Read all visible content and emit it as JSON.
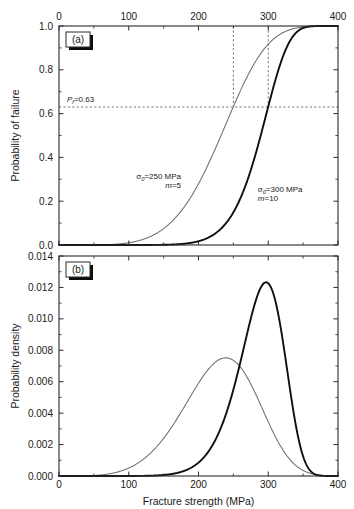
{
  "figure": {
    "width": 354,
    "height": 509,
    "background": "#ffffff"
  },
  "panels": {
    "a": {
      "letter": "(a)",
      "ylabel": "Probability of failure",
      "y_ticks": [
        "0.0",
        "0.2",
        "0.4",
        "0.6",
        "0.8",
        "1.0"
      ],
      "x_ticks": [
        "0",
        "100",
        "200",
        "300",
        "400"
      ],
      "x_axis_position": "top",
      "annotations": {
        "pf_label_main": "P",
        "pf_label_sub": "f",
        "pf_label_value": "=0.63",
        "curve1_sigma_main": "σ",
        "curve1_sigma_sub": "0",
        "curve1_sigma_value": "=250 MPa",
        "curve1_m_italic": "m",
        "curve1_m_value": "=5",
        "curve2_sigma_main": "σ",
        "curve2_sigma_sub": "0",
        "curve2_sigma_value": "=300 MPa",
        "curve2_m_italic": "m",
        "curve2_m_value": "=10"
      }
    },
    "b": {
      "letter": "(b)",
      "ylabel": "Probability density",
      "y_ticks": [
        "0.000",
        "0.002",
        "0.004",
        "0.006",
        "0.008",
        "0.010",
        "0.012",
        "0.014"
      ],
      "x_ticks": [
        "0",
        "100",
        "200",
        "300",
        "400"
      ],
      "x_axis_position": "bottom"
    }
  },
  "xlabel": "Fracture strength (MPa)",
  "colors": {
    "curve_m5": "#6e6e6e",
    "curve_m10": "#101010",
    "axis": "#2b2b2b",
    "guide": "#555555",
    "text": "#1a1a1a",
    "background": "#ffffff"
  },
  "chart_data": [
    {
      "type": "line",
      "panel": "(a)",
      "title": "",
      "xlabel": "Fracture strength (MPa)",
      "ylabel": "Probability of failure",
      "xlim": [
        0,
        400
      ],
      "ylim": [
        0.0,
        1.0
      ],
      "xticks": [
        0,
        100,
        200,
        300,
        400
      ],
      "yticks": [
        0.0,
        0.2,
        0.4,
        0.6,
        0.8,
        1.0
      ],
      "x_axis_position": "top",
      "grid": false,
      "legend": "none",
      "function": "Weibull CDF: P = 1 - exp(-(x/sigma0)^m)",
      "series": [
        {
          "name": "sigma0=250 MPa, m=5",
          "color": "#6e6e6e",
          "linewidth": "thin",
          "sigma0": 250,
          "m": 5,
          "x": [
            0,
            20,
            40,
            60,
            80,
            100,
            120,
            140,
            160,
            180,
            200,
            220,
            240,
            250,
            260,
            280,
            300,
            320,
            340,
            360,
            380,
            400
          ],
          "y": [
            0.0,
            0.0,
            0.0,
            0.001,
            0.001,
            0.01,
            0.022,
            0.058,
            0.114,
            0.201,
            0.306,
            0.441,
            0.585,
            0.632,
            0.704,
            0.788,
            0.885,
            0.942,
            0.975,
            0.99,
            0.996,
            0.999
          ]
        },
        {
          "name": "sigma0=300 MPa, m=10",
          "color": "#101010",
          "linewidth": "thick",
          "sigma0": 300,
          "m": 10,
          "x": [
            0,
            50,
            100,
            120,
            140,
            160,
            180,
            200,
            220,
            240,
            260,
            280,
            300,
            310,
            320,
            340,
            360,
            380,
            400
          ],
          "y": [
            0.0,
            0.0,
            0.0,
            0.0,
            0.001,
            0.003,
            0.008,
            0.017,
            0.042,
            0.095,
            0.192,
            0.349,
            0.632,
            0.712,
            0.8,
            0.93,
            0.983,
            0.997,
            1.0
          ]
        }
      ],
      "annotations": [
        {
          "text": "Pf=0.63",
          "x": 62,
          "y": 0.63,
          "type": "horizontal-guide-label"
        },
        {
          "text": "sigma0=250 MPa / m=5",
          "x": 175,
          "y": 0.3,
          "type": "curve-label"
        },
        {
          "text": "sigma0=300 MPa / m=10",
          "x": 285,
          "y": 0.24,
          "type": "curve-label"
        }
      ],
      "guides": [
        {
          "type": "horizontal",
          "value": 0.63,
          "style": "dashed"
        },
        {
          "type": "vertical",
          "value": 250,
          "style": "dashed"
        },
        {
          "type": "vertical",
          "value": 300,
          "style": "dashed"
        }
      ]
    },
    {
      "type": "line",
      "panel": "(b)",
      "title": "",
      "xlabel": "Fracture strength (MPa)",
      "ylabel": "Probability density",
      "xlim": [
        0,
        400
      ],
      "ylim": [
        0.0,
        0.014
      ],
      "xticks": [
        0,
        100,
        200,
        300,
        400
      ],
      "yticks": [
        0.0,
        0.002,
        0.004,
        0.006,
        0.008,
        0.01,
        0.012,
        0.014
      ],
      "x_axis_position": "bottom",
      "grid": false,
      "legend": "none",
      "function": "Weibull PDF: p = (m/sigma0)(x/sigma0)^(m-1) exp(-(x/sigma0)^m)",
      "series": [
        {
          "name": "sigma0=250 MPa, m=5",
          "color": "#6e6e6e",
          "linewidth": "thin",
          "sigma0": 250,
          "m": 5,
          "peak_x": 235,
          "peak_y": 0.0076,
          "x": [
            0,
            40,
            60,
            80,
            100,
            120,
            140,
            160,
            180,
            200,
            220,
            235,
            250,
            270,
            290,
            310,
            330,
            350,
            370,
            390,
            400
          ],
          "y": [
            0.0,
            0.0001,
            0.0003,
            0.0007,
            0.0013,
            0.0022,
            0.0033,
            0.0046,
            0.0059,
            0.0069,
            0.0075,
            0.0076,
            0.0074,
            0.0065,
            0.005,
            0.0034,
            0.0019,
            0.0009,
            0.0003,
            0.0001,
            0.0
          ]
        },
        {
          "name": "sigma0=300 MPa, m=10",
          "color": "#101010",
          "linewidth": "thick",
          "sigma0": 300,
          "m": 10,
          "peak_x": 300,
          "peak_y": 0.0123,
          "x": [
            0,
            80,
            120,
            150,
            170,
            190,
            210,
            230,
            250,
            265,
            280,
            290,
            300,
            310,
            320,
            330,
            345,
            360,
            375,
            390,
            400
          ],
          "y": [
            0.0,
            0.0,
            0.0001,
            0.0002,
            0.0005,
            0.001,
            0.0019,
            0.0035,
            0.006,
            0.008,
            0.0102,
            0.0114,
            0.0123,
            0.0122,
            0.0112,
            0.0093,
            0.0057,
            0.0026,
            0.0008,
            0.0001,
            0.0
          ]
        }
      ]
    }
  ]
}
